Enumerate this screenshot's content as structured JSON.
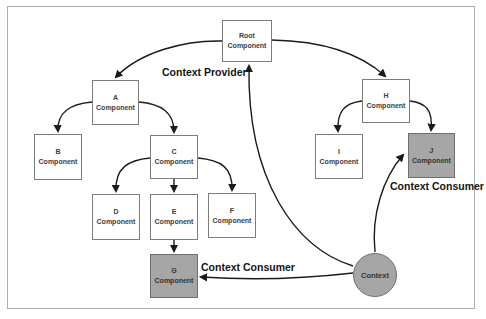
{
  "labels": {
    "context_provider": "Context Provider",
    "context_consumer_right": "Context Consumer",
    "context_consumer_left": "Context Consumer"
  },
  "nodes": {
    "root": {
      "line1": "Root",
      "line2": "Component",
      "role": "context-provider"
    },
    "a": {
      "line1": "A",
      "line2": "Component"
    },
    "b": {
      "line1": "B",
      "line2": "Component"
    },
    "c": {
      "line1": "C",
      "line2": "Component"
    },
    "d": {
      "line1": "D",
      "line2": "Component"
    },
    "e": {
      "line1": "E",
      "line2": "Component"
    },
    "f": {
      "line1": "F",
      "line2": "Component"
    },
    "g": {
      "line1": "G",
      "line2": "Component",
      "role": "context-consumer"
    },
    "h": {
      "line1": "H",
      "line2": "Component"
    },
    "i": {
      "line1": "I",
      "line2": "Component"
    },
    "j": {
      "line1": "J",
      "line2": "Component",
      "role": "context-consumer"
    }
  },
  "context": {
    "label": "Context"
  },
  "edges": [
    {
      "from": "root",
      "to": "a"
    },
    {
      "from": "root",
      "to": "h"
    },
    {
      "from": "a",
      "to": "b"
    },
    {
      "from": "a",
      "to": "c"
    },
    {
      "from": "c",
      "to": "d"
    },
    {
      "from": "c",
      "to": "e"
    },
    {
      "from": "c",
      "to": "f"
    },
    {
      "from": "e",
      "to": "g"
    },
    {
      "from": "h",
      "to": "i"
    },
    {
      "from": "h",
      "to": "j"
    },
    {
      "from": "context",
      "to": "root"
    },
    {
      "from": "context",
      "to": "j"
    },
    {
      "from": "context",
      "to": "g"
    }
  ],
  "colors": {
    "highlight_fill": "#a6a6a6",
    "box_border": "#7d7d7d",
    "arrow": "#1b1b1b",
    "frame_border": "#aeaeae"
  }
}
